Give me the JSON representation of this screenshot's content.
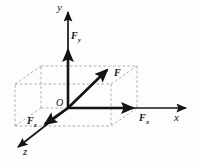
{
  "figure": {
    "background_color": "#fdfdfd",
    "stroke_color": "#141414",
    "dashed_color": "#9a9a9a",
    "axes": {
      "y": {
        "label": "y",
        "description": "vertical axis pointing up"
      },
      "x": {
        "label": "x",
        "description": "horizontal axis pointing right"
      },
      "z": {
        "label": "z",
        "description": "oblique axis pointing down-left toward viewer"
      }
    },
    "origin": {
      "label": "O"
    },
    "vectors": [
      {
        "name": "resultant-force",
        "label": "F",
        "subscript": "",
        "description": "bold resultant force vector from origin to far top corner of box"
      },
      {
        "name": "force-component-y",
        "label": "F",
        "subscript": "y",
        "description": "vertical component of F along the y axis"
      },
      {
        "name": "force-component-x",
        "label": "F",
        "subscript": "x",
        "description": "horizontal component of F along the x axis"
      },
      {
        "name": "force-component-z",
        "label": "F",
        "subscript": "z",
        "description": "component of F along the z axis"
      }
    ],
    "construction": {
      "shape": "rectangular-box",
      "line_style": "dashed",
      "description": "dashed rectangular parallelepiped whose edges project the resultant force onto the three axes"
    }
  },
  "geometry": {
    "origin_px": [
      68,
      108
    ],
    "y_axis_tip_px": [
      68,
      10
    ],
    "x_axis_tip_px": [
      190,
      108
    ],
    "z_axis_tip_px": [
      14,
      150
    ],
    "fy_tip_px": [
      68,
      46
    ],
    "fx_tip_px": [
      137,
      108
    ],
    "fz_tip_px": [
      42,
      126
    ],
    "f_tip_px": [
      111,
      66
    ],
    "box_front_bottom_left_px": [
      41,
      126
    ],
    "box_back_bottom_left_px": [
      41,
      108
    ],
    "box_back_bottom_right_px": [
      137,
      108
    ],
    "box_front_bottom_right_px": [
      111,
      126
    ],
    "box_back_top_left_px": [
      41,
      66
    ],
    "box_back_top_right_px": [
      137,
      66
    ],
    "box_front_top_left_px": [
      41,
      84
    ],
    "box_front_top_right_px": [
      111,
      66
    ]
  }
}
